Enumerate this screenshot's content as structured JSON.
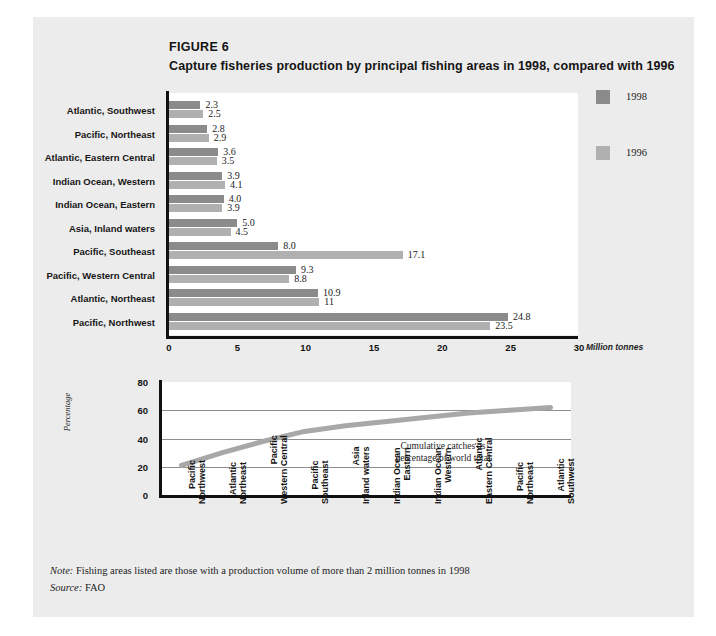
{
  "figure": {
    "number": "FIGURE 6",
    "title": "Capture fisheries production by principal fishing areas in 1998, compared with 1996"
  },
  "legend": {
    "items": [
      {
        "label": "1998",
        "color": "#8b8b8b"
      },
      {
        "label": "1996",
        "color": "#b0b0b0"
      }
    ]
  },
  "axis": {
    "unit_label": "Million tonnes",
    "x_ticks": [
      "0",
      "5",
      "10",
      "15",
      "20",
      "25",
      "30"
    ],
    "percent_ticks": [
      "0",
      "20",
      "40",
      "60",
      "80"
    ],
    "percent_axis_label": "Percentage"
  },
  "annotation": {
    "line1": "Cumulative catches as",
    "line2": "percentage of world total"
  },
  "notes": {
    "note_prefix": "Note:",
    "note_text": " Fishing areas listed are those with a production volume of more than 2 million tonnes in 1998",
    "source_prefix": "Source:",
    "source_text": " FAO"
  },
  "chart_data": [
    {
      "type": "bar",
      "title": "Capture fisheries production by principal fishing areas in 1998, compared with 1996",
      "xlabel": "Million tonnes",
      "ylabel": "",
      "xlim": [
        0,
        30
      ],
      "grid": false,
      "legend_position": "right",
      "orientation": "horizontal",
      "categories": [
        "Atlantic, Southwest",
        "Pacific, Northeast",
        "Atlantic, Eastern Central",
        "Indian Ocean, Western",
        "Indian Ocean, Eastern",
        "Asia, Inland waters",
        "Pacific, Southeast",
        "Pacific, Western Central",
        "Atlantic, Northeast",
        "Pacific, Northwest"
      ],
      "series": [
        {
          "name": "1998",
          "color": "#8b8b8b",
          "values": [
            2.3,
            2.8,
            3.6,
            3.9,
            4.0,
            5.0,
            8.0,
            9.3,
            10.9,
            24.8
          ],
          "labels": [
            "2.3",
            "2.8",
            "3.6",
            "3.9",
            "4.0",
            "5.0",
            "8.0",
            "9.3",
            "10.9",
            "24.8"
          ]
        },
        {
          "name": "1996",
          "color": "#b0b0b0",
          "values": [
            2.5,
            2.9,
            3.5,
            4.1,
            3.9,
            4.5,
            17.1,
            8.8,
            11.0,
            23.5
          ],
          "labels": [
            "2.5",
            "2.9",
            "3.5",
            "4.1",
            "3.9",
            "4.5",
            "17.1",
            "8.8",
            "11",
            "23.5"
          ]
        }
      ]
    },
    {
      "type": "line",
      "title": "Cumulative catches as percentage of world total",
      "xlabel": "",
      "ylabel": "Percentage",
      "ylim": [
        0,
        80
      ],
      "yticks": [
        0,
        20,
        40,
        60,
        80
      ],
      "grid": true,
      "legend_position": "none",
      "color": "#a8a8a8",
      "categories": [
        "Pacific, Northwest",
        "Atlantic, Northeast",
        "Pacific, Western Central",
        "Pacific, Southeast",
        "Asia, Inland waters",
        "Indian Ocean, Eastern",
        "Indian Ocean, Western",
        "Atlantic, Eastern Central",
        "Pacific, Northeast",
        "Atlantic, Southwest"
      ],
      "values": [
        21,
        30,
        38,
        45,
        49,
        52,
        55,
        58,
        60,
        62
      ]
    }
  ]
}
